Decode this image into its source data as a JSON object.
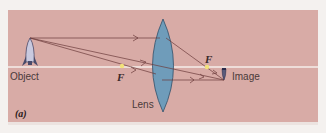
{
  "diagram": {
    "caption": "(a)",
    "labels": {
      "object": "Object",
      "image": "Image",
      "lens": "Lens",
      "focal_left": "F",
      "focal_right": "F"
    },
    "colors": {
      "background": "#d8aba6",
      "axis": "#f6eeea",
      "lens_fill": "#6f9cba",
      "lens_stroke": "#2f4f6a",
      "ray": "#6b3b3b",
      "focal_point": "#f2e27a"
    }
  }
}
